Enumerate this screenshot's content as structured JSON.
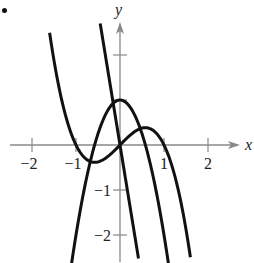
{
  "chart_data": {
    "type": "line",
    "title": "",
    "xlabel": "x",
    "ylabel": "y",
    "xlim": [
      -2.5,
      2.5
    ],
    "ylim": [
      -2.6,
      2.7
    ],
    "grid": false,
    "legend": null,
    "x_ticks": [
      -2,
      -1,
      1,
      2
    ],
    "x_tick_labels": [
      "−2",
      "−1",
      "1",
      "2"
    ],
    "y_ticks": [
      -2,
      -1,
      1,
      2
    ],
    "y_tick_labels": [
      "−2",
      "−1",
      "",
      ""
    ],
    "series": [
      {
        "name": "f(x) = x - x^3",
        "expression": "x - x^3",
        "x_range": [
          -1.6,
          1.6
        ],
        "key_points": [
          [
            -1.6,
            2.5
          ],
          [
            -1,
            0
          ],
          [
            -0.577,
            -0.385
          ],
          [
            0,
            0
          ],
          [
            0.577,
            0.385
          ],
          [
            1,
            0
          ],
          [
            1.6,
            -2.5
          ]
        ]
      },
      {
        "name": "f'(x) = 1 - 3x^2",
        "expression": "1 - 3x^2",
        "x_range": [
          -1.1,
          1.1
        ],
        "key_points": [
          [
            -1.1,
            -2.63
          ],
          [
            -0.577,
            0
          ],
          [
            0,
            1
          ],
          [
            0.577,
            0
          ],
          [
            1.1,
            -2.63
          ]
        ]
      },
      {
        "name": "f''(x) = -6x",
        "expression": "-6x",
        "x_range": [
          -0.45,
          0.42
        ],
        "key_points": [
          [
            -0.45,
            2.7
          ],
          [
            0,
            0
          ],
          [
            0.42,
            -2.52
          ]
        ]
      }
    ]
  },
  "labels": {
    "x_axis": "x",
    "y_axis": "y"
  },
  "style": {
    "curve_color": "#111111",
    "axis_color": "#888888"
  }
}
